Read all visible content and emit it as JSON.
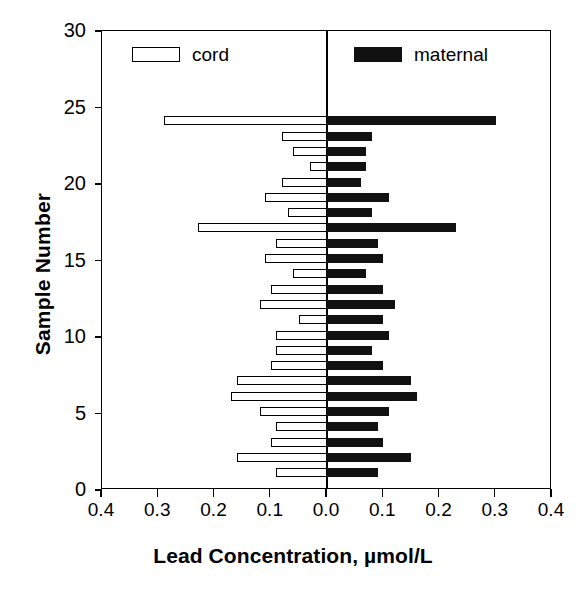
{
  "chart_data": {
    "type": "bar",
    "orientation": "horizontal-pyramid",
    "title": "",
    "xlabel": "Lead Concentration, µmol/L",
    "ylabel": "Sample Number",
    "xlim": [
      -0.4,
      0.4
    ],
    "ylim": [
      0,
      30
    ],
    "xticks": [
      -0.4,
      -0.3,
      -0.2,
      -0.1,
      0.0,
      0.1,
      0.2,
      0.3,
      0.4
    ],
    "xtick_labels": [
      "0.4",
      "0.3",
      "0.2",
      "0.1",
      "0.0",
      "0.1",
      "0.2",
      "0.3",
      "0.4"
    ],
    "yticks": [
      0,
      5,
      10,
      15,
      20,
      25,
      30
    ],
    "ytick_labels": [
      "0",
      "5",
      "10",
      "15",
      "20",
      "25",
      "30"
    ],
    "grid": false,
    "legend_position": "top-inside",
    "legend": [
      {
        "name": "cord",
        "style": "open",
        "color": "#ffffff",
        "edge": "#000000"
      },
      {
        "name": "maternal",
        "style": "filled",
        "color": "#111111",
        "edge": "#111111"
      }
    ],
    "categories": [
      1,
      2,
      3,
      4,
      5,
      6,
      7,
      8,
      9,
      10,
      11,
      12,
      13,
      14,
      15,
      16,
      17,
      18,
      19,
      20,
      21,
      22,
      23,
      24
    ],
    "series": [
      {
        "name": "cord",
        "side": "left",
        "values": [
          0.09,
          0.16,
          0.1,
          0.09,
          0.12,
          0.17,
          0.16,
          0.1,
          0.09,
          0.09,
          0.05,
          0.12,
          0.1,
          0.06,
          0.11,
          0.09,
          0.23,
          0.07,
          0.11,
          0.08,
          0.03,
          0.06,
          0.08,
          0.29
        ]
      },
      {
        "name": "maternal",
        "side": "right",
        "values": [
          0.09,
          0.15,
          0.1,
          0.09,
          0.11,
          0.16,
          0.15,
          0.1,
          0.08,
          0.11,
          0.1,
          0.12,
          0.1,
          0.07,
          0.1,
          0.09,
          0.23,
          0.08,
          0.11,
          0.06,
          0.07,
          0.07,
          0.08,
          0.3
        ]
      }
    ]
  },
  "axes": {
    "y_title": "Sample Number",
    "x_title": "Lead Concentration, µmol/L"
  },
  "legend": {
    "cord_label": "cord",
    "maternal_label": "maternal"
  },
  "colors": {
    "cord_fill": "#ffffff",
    "maternal_fill": "#111111",
    "axis": "#000000",
    "background": "#ffffff"
  }
}
